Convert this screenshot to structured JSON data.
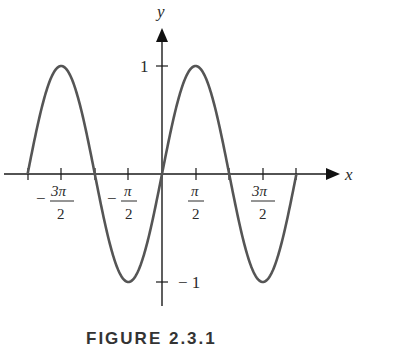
{
  "chart_data": {
    "type": "line",
    "title": "",
    "function": "y = sin x",
    "xlabel": "x",
    "ylabel": "y",
    "xlim": [
      -6.283,
      6.283
    ],
    "ylim": [
      -1,
      1
    ],
    "grid": false,
    "legend": null,
    "x_ticks": [
      {
        "value": -4.712,
        "label_num": "3π",
        "label_den": "2",
        "sign": "−"
      },
      {
        "value": -1.571,
        "label_num": "π",
        "label_den": "2",
        "sign": "−"
      },
      {
        "value": 1.571,
        "label_num": "π",
        "label_den": "2",
        "sign": ""
      },
      {
        "value": 4.712,
        "label_num": "3π",
        "label_den": "2",
        "sign": ""
      }
    ],
    "y_ticks": [
      {
        "value": 1,
        "label": "1"
      },
      {
        "value": -1,
        "label": "− 1"
      }
    ],
    "x": [
      -6.283,
      -4.712,
      -3.142,
      -1.571,
      0,
      1.571,
      3.142,
      4.712,
      6.283
    ],
    "values": [
      0,
      1,
      0,
      -1,
      0,
      1,
      0,
      -1,
      0
    ],
    "curve_color": "#555555",
    "axis_color": "#1a1a1a"
  },
  "labels": {
    "x_axis": "x",
    "y_axis": "y",
    "y_tick_pos": "1",
    "y_tick_neg": "− 1",
    "xt0_sign": "−",
    "xt0_num": "3π",
    "xt0_den": "2",
    "xt1_sign": "−",
    "xt1_num": "π",
    "xt1_den": "2",
    "xt2_num": "π",
    "xt2_den": "2",
    "xt3_num": "3π",
    "xt3_den": "2"
  },
  "caption": "FIGURE 2.3.1"
}
